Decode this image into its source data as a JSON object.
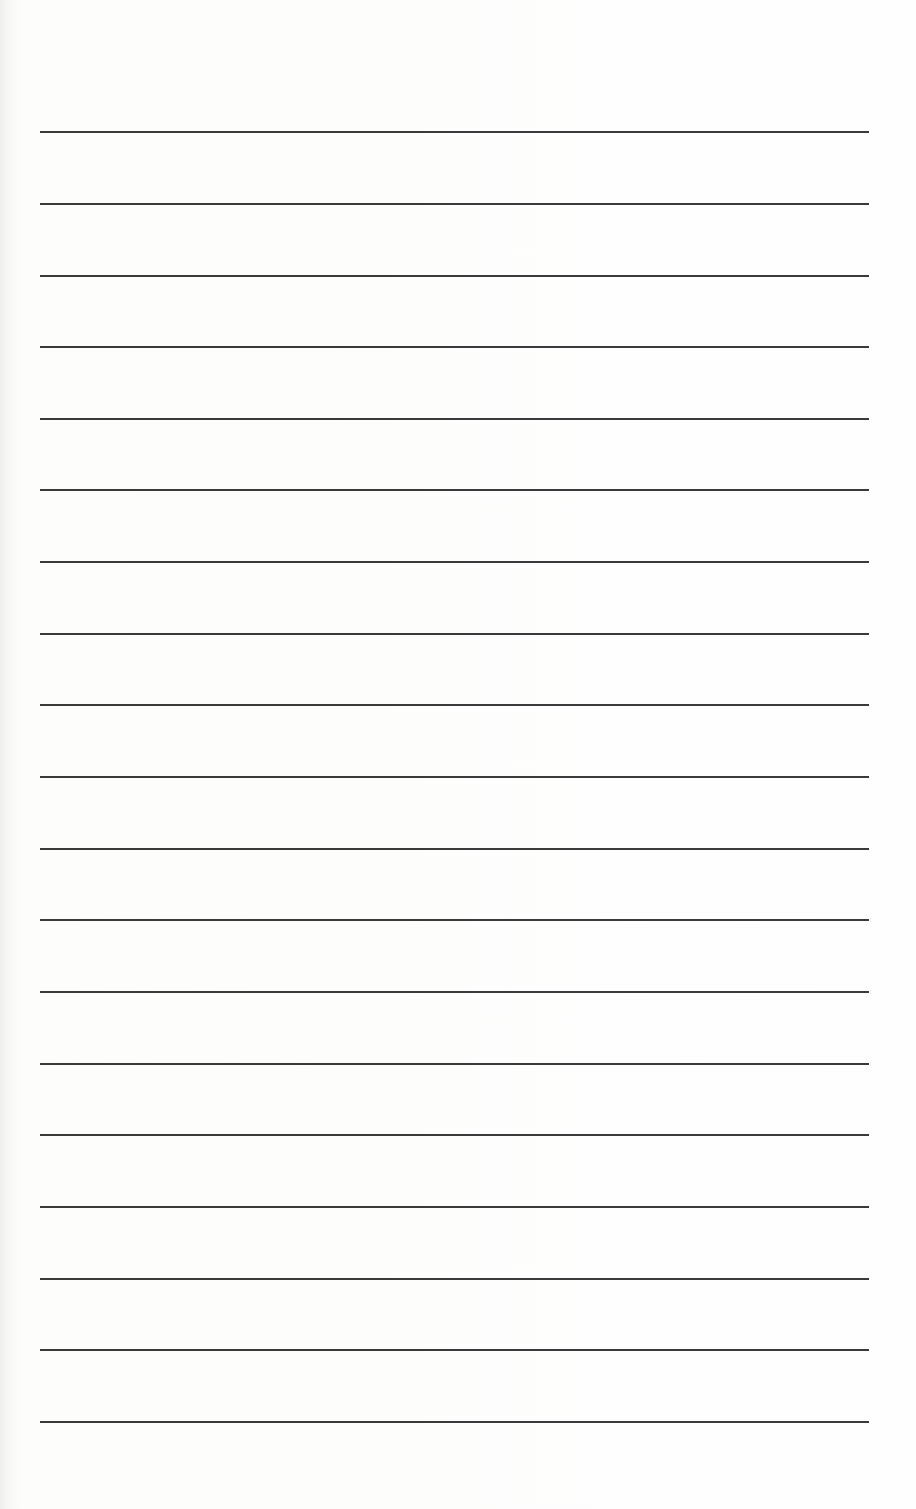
{
  "document": {
    "type": "lined-paper",
    "background_color": "#fdfdfc",
    "line_color": "#3a3a3a",
    "line_thickness_px": 2,
    "line_left_px": 40,
    "line_right_px": 869,
    "lines_y_px": [
      132,
      204,
      276,
      347,
      419,
      490,
      562,
      634,
      705,
      777,
      849,
      920,
      992,
      1064,
      1135,
      1207,
      1279,
      1350,
      1422
    ],
    "line_count": 19
  }
}
